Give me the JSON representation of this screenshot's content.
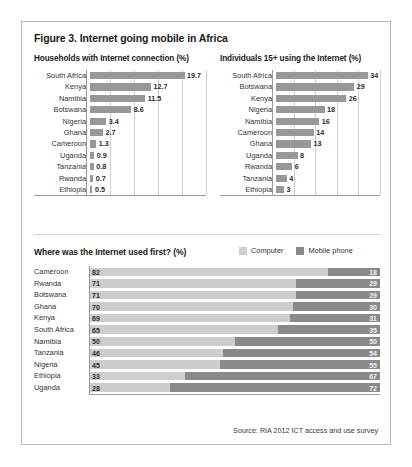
{
  "figure": {
    "title": "Figure 3. Internet going mobile in Africa",
    "source": "Source: RIA 2012 ICT access and use survey"
  },
  "legend": {
    "computer": "Computer",
    "mobile": "Mobile phone"
  },
  "colors": {
    "bar": "#989898",
    "computer": "#cdcdcd",
    "mobile": "#8a8a8a",
    "gridline": "#cfcfcf",
    "axis": "#9a9a9a",
    "border": "#b9b9b9"
  },
  "chart_data": [
    {
      "type": "bar",
      "title": "Households with Internet connection (%)",
      "orientation": "horizontal",
      "categories": [
        "South Africa",
        "Kenya",
        "Namibia",
        "Botswana",
        "Nigeria",
        "Ghana",
        "Cameroon",
        "Uganda",
        "Tanzania",
        "Rwanda",
        "Ethiopia"
      ],
      "values": [
        19.7,
        12.7,
        11.5,
        8.6,
        3.4,
        2.7,
        1.3,
        0.9,
        0.8,
        0.7,
        0.5
      ],
      "value_labels": [
        "19.7",
        "12.7",
        "11.5",
        "8.6",
        "3.4",
        "2.7",
        "1.3",
        "0.9",
        "0.8",
        "0.7",
        "0.5"
      ],
      "xlabel": "",
      "ylabel": "",
      "xlim": [
        0,
        25
      ],
      "gridlines": [
        5,
        10,
        15,
        20,
        25
      ],
      "grid": true,
      "legend": false
    },
    {
      "type": "bar",
      "title": "Individuals 15+ using the Internet (%)",
      "orientation": "horizontal",
      "categories": [
        "South Africa",
        "Botswana",
        "Kenya",
        "Nigeria",
        "Namibia",
        "Cameroon",
        "Ghana",
        "Uganda",
        "Rwanda",
        "Tanzania",
        "Ethiopia"
      ],
      "values": [
        34,
        29,
        26,
        18,
        16,
        14,
        13,
        8,
        6,
        4,
        3
      ],
      "value_labels": [
        "34",
        "29",
        "26",
        "18",
        "16",
        "14",
        "13",
        "8",
        "6",
        "4",
        "3"
      ],
      "xlabel": "",
      "ylabel": "",
      "xlim": [
        0,
        40
      ],
      "gridlines": [
        8,
        16,
        24,
        32,
        40
      ],
      "grid": true,
      "legend": false
    },
    {
      "type": "bar",
      "subtype": "stacked-100",
      "title": "Where was the Internet used first? (%)",
      "orientation": "horizontal",
      "categories": [
        "Cameroon",
        "Rwanda",
        "Botswana",
        "Ghana",
        "Kenya",
        "South Africa",
        "Namibia",
        "Tanzania",
        "Nigeria",
        "Ethiopia",
        "Uganda"
      ],
      "series": [
        {
          "name": "Computer",
          "values": [
            82,
            71,
            71,
            70,
            69,
            65,
            50,
            46,
            45,
            33,
            28
          ],
          "value_labels": [
            "82",
            "71",
            "71",
            "70",
            "69",
            "65",
            "50",
            "46",
            "45",
            "33",
            "28"
          ]
        },
        {
          "name": "Mobile phone",
          "values": [
            18,
            29,
            29,
            30,
            31,
            35,
            50,
            54,
            55,
            67,
            72
          ],
          "value_labels": [
            "18",
            "29",
            "29",
            "30",
            "31",
            "35",
            "50",
            "54",
            "55",
            "67",
            "72"
          ]
        }
      ],
      "xlabel": "",
      "ylabel": "",
      "xlim": [
        0,
        100
      ],
      "grid": false,
      "legend": true,
      "legend_position": "top-right"
    }
  ]
}
